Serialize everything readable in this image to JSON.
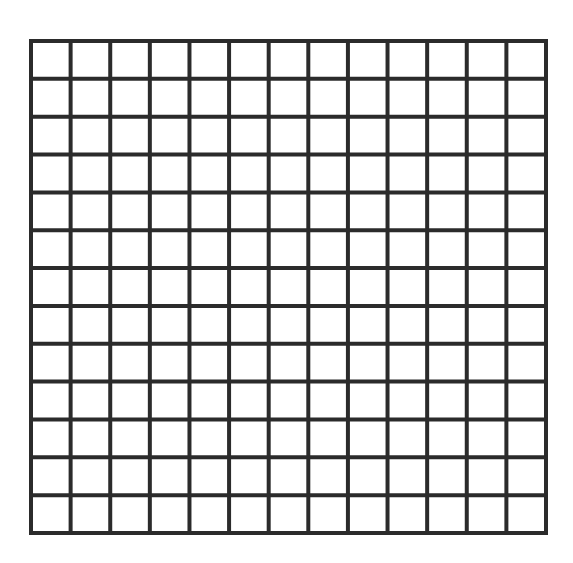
{
  "diagram": {
    "type": "grid",
    "rows": 13,
    "columns": 13,
    "bounds": {
      "left": 31,
      "top": 41,
      "right": 546,
      "bottom": 533
    },
    "line_width": 4,
    "line_color": "#2b2b2b",
    "background_color": "#ffffff",
    "cell_fill": "#ffffff"
  }
}
